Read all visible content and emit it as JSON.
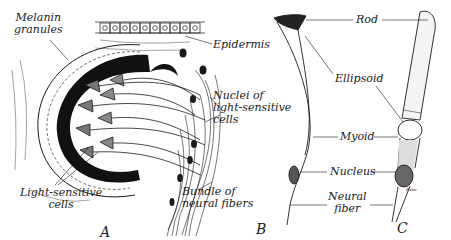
{
  "figure": {
    "panels": [
      {
        "id": "A",
        "label": "A"
      },
      {
        "id": "B",
        "label": "B"
      },
      {
        "id": "C",
        "label": "C"
      }
    ],
    "labels": {
      "melanin_granules": [
        "Melanin",
        "granules"
      ],
      "epidermis": "Epidermis",
      "nuclei": [
        "Nuclei of",
        "light-sensitive",
        "cells"
      ],
      "light_sensitive_cells": [
        "Light-sensitive",
        "cells"
      ],
      "bundle": [
        "Bundle of",
        "neural fibers"
      ],
      "rod": "Rod",
      "ellipsoid": "Ellipsoid",
      "myoid": "Myoid",
      "nucleus": "Nucleus",
      "neural_fiber": [
        "Neural",
        "fiber"
      ]
    },
    "signature": "Bunn",
    "colors": {
      "ink": "#1a1a1a",
      "pigment": "#111111",
      "background": "#ffffff"
    }
  }
}
